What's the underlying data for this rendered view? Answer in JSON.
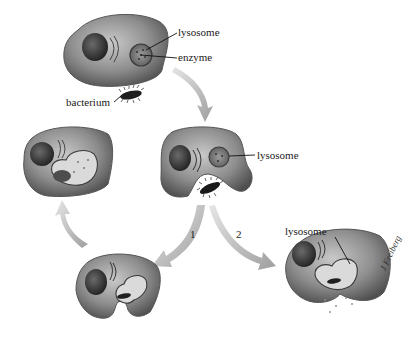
{
  "diagram": {
    "type": "biological process diagram",
    "colors": {
      "cell_body": "#8a8a8a",
      "cell_light": "#c8c8c8",
      "nucleus": "#3c3c3c",
      "arrow": "#a9a9a9",
      "text": "#1a1a1a",
      "background": "#ffffff"
    },
    "stages": [
      {
        "id": "cell-1",
        "description": "Cell with lysosome approaching bacterium",
        "labels": [
          "lysosome",
          "enzyme",
          "bacterium"
        ]
      },
      {
        "id": "cell-2",
        "description": "Cell engulfing bacterium",
        "labels": [
          "lysosome"
        ]
      },
      {
        "id": "cell-3",
        "description": "Bacterium enclosed in vesicle (path 1)",
        "labels": []
      },
      {
        "id": "cell-4",
        "description": "Lysosome fused with vesicle, digesting bacterium",
        "labels": []
      },
      {
        "id": "cell-5",
        "description": "Lysosome fuses before closure (path 2)",
        "labels": [
          "lysosome"
        ]
      }
    ],
    "labels": {
      "lysosome_1": "lysosome",
      "enzyme": "enzyme",
      "bacterium": "bacterium",
      "lysosome_2": "lysosome",
      "lysosome_3": "lysosome"
    },
    "paths": {
      "path_1": "1",
      "path_2": "2"
    },
    "signature": "J Freiberg"
  }
}
